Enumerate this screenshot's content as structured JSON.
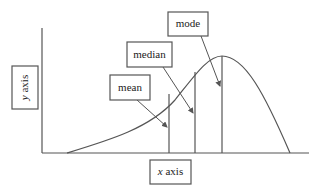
{
  "diagram": {
    "type": "skewed-distribution",
    "labels": {
      "mode": "mode",
      "median": "median",
      "mean": "mean",
      "x_axis_var": "x",
      "x_axis_word": " axis",
      "y_axis_var": "y",
      "y_axis_word": " axis"
    },
    "order_left_to_right": [
      "mean",
      "median",
      "mode"
    ],
    "colors": {
      "stroke": "#555555",
      "text": "#222222",
      "background": "#ffffff"
    }
  }
}
